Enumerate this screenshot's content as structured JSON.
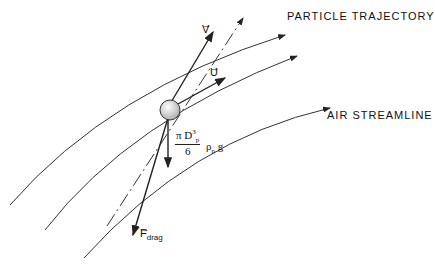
{
  "diagram": {
    "labels": {
      "particle_trajectory": "PARTICLE TRAJECTORY",
      "air_streamline": "AIR STREAMLINE",
      "velocity_particle": "V",
      "velocity_air": "U",
      "drag_force_symbol": "F",
      "drag_force_subscript": "drag",
      "gravity_numerator": "π D",
      "gravity_num_sup": "3",
      "gravity_num_sub": "p",
      "gravity_denominator": "6",
      "gravity_rest": "ρ",
      "gravity_rest_sub": "p",
      "gravity_g": "g"
    },
    "colors": {
      "line": "#222222",
      "background": "#ffffff",
      "sphere": "#dddddd"
    }
  }
}
